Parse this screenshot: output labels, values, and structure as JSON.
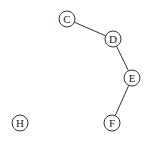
{
  "graph": {
    "nodes": [
      {
        "id": "C",
        "label": "C",
        "x": 67,
        "y": 19
      },
      {
        "id": "D",
        "label": "D",
        "x": 113,
        "y": 39
      },
      {
        "id": "E",
        "label": "E",
        "x": 132,
        "y": 78
      },
      {
        "id": "F",
        "label": "F",
        "x": 112,
        "y": 123
      },
      {
        "id": "H",
        "label": "H",
        "x": 20,
        "y": 123
      }
    ],
    "edges": [
      {
        "from": "C",
        "to": "D"
      },
      {
        "from": "D",
        "to": "E"
      },
      {
        "from": "E",
        "to": "F"
      }
    ],
    "node_radius": 8
  }
}
